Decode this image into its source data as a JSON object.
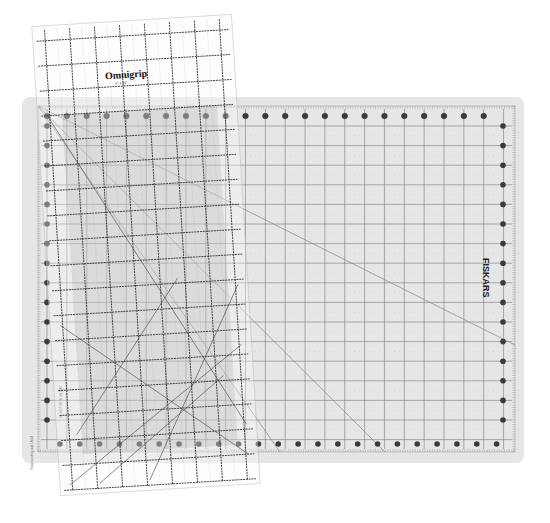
{
  "scene": {
    "width": 550,
    "height": 523,
    "background": "#ffffff"
  },
  "mat": {
    "brand": "FISKARS",
    "x": 22,
    "y": 97,
    "width": 502,
    "height": 366,
    "corner_radius": 8,
    "fill": "#e6e6e6",
    "border_fill": "#ececec",
    "grid": {
      "x0": 38,
      "x1": 515,
      "y0": 106,
      "y1": 452,
      "col_start": 47,
      "col_spacing": 19.85,
      "cols": 24,
      "row_start": 126,
      "row_spacing": 19.6,
      "rows": 17,
      "line_color": "#7a7a7a"
    },
    "dots": {
      "top_y": 116,
      "bottom_y": 444,
      "left_x": 47,
      "right_x": 503,
      "radius": 2.8,
      "color": "#3a3a3a"
    },
    "diagonals": [
      {
        "x1": 38,
        "y1": 106,
        "x2": 515,
        "y2": 345
      },
      {
        "x1": 38,
        "y1": 106,
        "x2": 385,
        "y2": 452
      },
      {
        "x1": 38,
        "y1": 106,
        "x2": 280,
        "y2": 452
      }
    ],
    "side_text_left": "Fiskars cutting mat 18x24",
    "side_text_bottom_left": "DO NOT IRON ON MAT"
  },
  "ruler": {
    "brand": "Omnigrip",
    "cx": 146,
    "cy": 255,
    "width": 200,
    "height": 470,
    "angle": -3.5,
    "fill": "rgba(250,250,250,0.35)",
    "grid_spacing": 25,
    "line_color": "#333333",
    "label_small": "6\" x 24\""
  }
}
